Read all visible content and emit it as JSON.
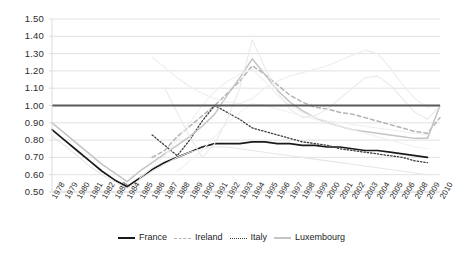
{
  "chart_data": {
    "type": "line",
    "title": "",
    "xlabel": "",
    "ylabel": "",
    "ylim": [
      0.5,
      1.5
    ],
    "ytick_step": 0.1,
    "grid": true,
    "legend_position": "bottom",
    "reference_line": {
      "value": 1.0,
      "label": "1.00",
      "color": "#595959",
      "width": 2.2
    },
    "yticks": [
      "1.50",
      "1.40",
      "1.30",
      "1.20",
      "1.10",
      "1.00",
      "0.90",
      "0.80",
      "0.70",
      "0.60",
      "0.50"
    ],
    "ytick_values": [
      1.5,
      1.4,
      1.3,
      1.2,
      1.1,
      1.0,
      0.9,
      0.8,
      0.7,
      0.6,
      0.5
    ],
    "categories": [
      "1978",
      "1979",
      "1980",
      "1981",
      "1982",
      "1983",
      "1984",
      "1985",
      "1986",
      "1987",
      "1988",
      "1989",
      "1990",
      "1991",
      "1992",
      "1993",
      "1994",
      "1995",
      "1996",
      "1997",
      "1998",
      "1999",
      "2000",
      "2001",
      "2002",
      "2003",
      "2004",
      "2005",
      "2006",
      "2008",
      "2009",
      "2010"
    ],
    "series": [
      {
        "name": "France",
        "color": "#1a1a1a",
        "style": "solid",
        "width": 1.7,
        "values": [
          0.86,
          0.8,
          0.74,
          0.68,
          0.62,
          0.57,
          0.53,
          0.58,
          0.63,
          0.67,
          0.7,
          0.73,
          0.76,
          0.78,
          0.78,
          0.78,
          0.79,
          0.79,
          0.78,
          0.78,
          0.77,
          0.77,
          0.76,
          0.76,
          0.75,
          0.74,
          0.74,
          0.73,
          0.72,
          0.71,
          0.7,
          null
        ]
      },
      {
        "name": "Ireland",
        "color": "#b3b3b3",
        "style": "dashed",
        "width": 1.5,
        "values": [
          null,
          null,
          null,
          null,
          null,
          null,
          null,
          null,
          0.7,
          0.74,
          0.82,
          0.88,
          0.94,
          1.0,
          1.07,
          1.14,
          1.23,
          1.18,
          1.12,
          1.06,
          1.02,
          0.99,
          0.98,
          0.96,
          0.95,
          0.93,
          0.91,
          0.89,
          0.87,
          0.85,
          0.84,
          0.93
        ]
      },
      {
        "name": "Italy",
        "color": "#3d3d3d",
        "style": "dotted",
        "width": 1.3,
        "values": [
          null,
          null,
          null,
          null,
          null,
          null,
          null,
          null,
          0.83,
          0.77,
          0.71,
          0.8,
          0.91,
          1.0,
          0.96,
          0.92,
          0.87,
          0.85,
          0.83,
          0.81,
          0.79,
          0.78,
          0.77,
          0.75,
          0.74,
          0.73,
          0.72,
          0.71,
          0.7,
          0.68,
          0.67,
          null
        ]
      },
      {
        "name": "Luxembourg",
        "color": "#c4c4c4",
        "style": "solid",
        "width": 1.5,
        "values": [
          0.9,
          0.84,
          0.78,
          0.72,
          0.66,
          0.61,
          0.56,
          0.62,
          0.67,
          0.72,
          0.77,
          0.82,
          0.88,
          0.95,
          1.06,
          1.16,
          1.27,
          1.18,
          1.09,
          1.02,
          0.97,
          0.93,
          0.9,
          0.88,
          0.86,
          0.85,
          0.84,
          0.83,
          0.82,
          0.81,
          0.81,
          1.0
        ]
      },
      {
        "name": "other-1",
        "color": "#e6e6e6",
        "style": "solid",
        "width": 1.1,
        "values": [
          0.82,
          0.77,
          0.71,
          0.65,
          0.6,
          0.56,
          0.52,
          0.57,
          0.62,
          0.66,
          0.7,
          0.73,
          0.75,
          0.76,
          0.76,
          0.75,
          0.74,
          0.73,
          0.72,
          0.71,
          0.7,
          0.69,
          0.68,
          0.67,
          0.66,
          0.65,
          0.64,
          0.63,
          0.62,
          0.61,
          0.6,
          null
        ]
      },
      {
        "name": "other-2",
        "color": "#eaeaea",
        "style": "solid",
        "width": 1.1,
        "values": [
          null,
          null,
          null,
          null,
          null,
          null,
          null,
          null,
          null,
          1.1,
          0.96,
          0.82,
          0.7,
          0.78,
          0.92,
          1.1,
          1.38,
          1.22,
          1.08,
          0.98,
          0.93,
          0.94,
          0.98,
          1.04,
          1.1,
          1.16,
          1.17,
          1.12,
          1.04,
          0.96,
          0.92,
          1.0
        ]
      },
      {
        "name": "other-3",
        "color": "#ededed",
        "style": "solid",
        "width": 1.1,
        "values": [
          null,
          null,
          null,
          null,
          null,
          null,
          null,
          null,
          1.28,
          1.22,
          1.16,
          1.11,
          1.07,
          1.04,
          1.02,
          1.01,
          1.04,
          1.1,
          1.14,
          1.17,
          1.19,
          1.21,
          1.23,
          1.26,
          1.29,
          1.32,
          1.3,
          1.22,
          1.12,
          1.04,
          0.99,
          1.0
        ]
      },
      {
        "name": "other-4",
        "color": "#efefef",
        "style": "solid",
        "width": 1.1,
        "values": [
          null,
          null,
          null,
          null,
          null,
          null,
          null,
          0.58,
          0.64,
          0.71,
          0.8,
          0.9,
          1.0,
          1.08,
          1.14,
          1.18,
          1.21,
          1.14,
          1.06,
          1.0,
          0.96,
          0.93,
          0.91,
          0.9,
          0.89,
          0.88,
          0.87,
          0.86,
          0.85,
          0.84,
          0.83,
          null
        ]
      },
      {
        "name": "other-5",
        "color": "#f1f1f1",
        "style": "solid",
        "width": 1.1,
        "values": [
          null,
          null,
          null,
          null,
          null,
          null,
          null,
          null,
          null,
          null,
          0.62,
          0.68,
          0.74,
          0.82,
          0.9,
          0.96,
          1.01,
          1.0,
          0.98,
          0.96,
          0.94,
          0.92,
          0.9,
          0.88,
          0.86,
          0.84,
          0.82,
          0.8,
          0.78,
          0.76,
          0.75,
          null
        ]
      }
    ],
    "legend": [
      {
        "label": "France",
        "style": "solid",
        "color": "#1a1a1a"
      },
      {
        "label": "Ireland",
        "style": "dashed",
        "color": "#b3b3b3"
      },
      {
        "label": "Italy",
        "style": "dotted",
        "color": "#3d3d3d"
      },
      {
        "label": "Luxembourg",
        "style": "solid",
        "color": "#c4c4c4"
      }
    ]
  },
  "axes": {
    "grid_color": "#d9d9d9",
    "text_color": "#2b2b2b"
  }
}
